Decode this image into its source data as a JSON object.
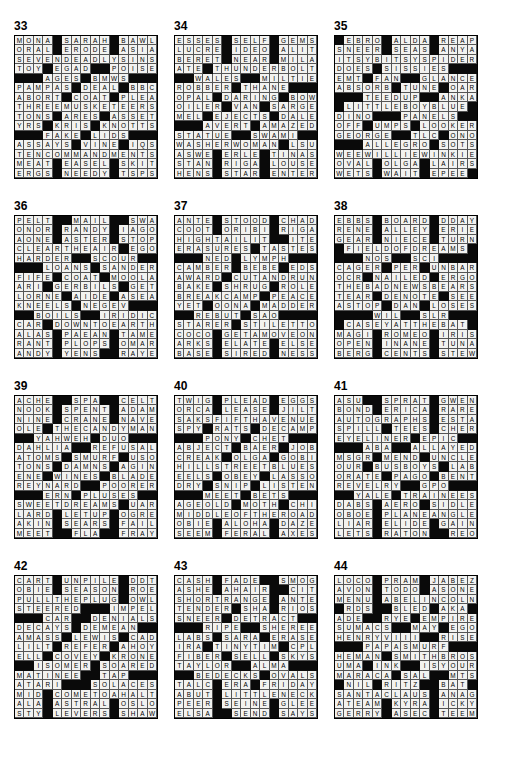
{
  "page": {
    "columns": 3,
    "rows": 4,
    "grid_size": 15,
    "block_char": "#",
    "colors": {
      "block": "#0a0a0a",
      "open": "#f2f2f0",
      "text": "#000000",
      "page_background": "#ffffff"
    }
  },
  "puzzles": [
    {
      "number": "33",
      "rows": [
        "MONA#SARAH#BAWL",
        "ORAL#ERODE#ASIA",
        "SEVENDEADLYSINS",
        "TOY#EGAD##POISES",
        "###AGES#BMWS###",
        "PAMPAS#DEAL#BBC",
        "ABORT#COAT#PLEA",
        "THREEMUSKETEERS",
        "TONS#ARES#ASSET",
        "YRS#KRIS#KNOTTS",
        "###FAKE#LIDS###",
        "ASSAYS#VINE#IQS",
        "TENCOMMANDMENTS",
        "MEAT#EASEL#SKIT",
        "ERGS#NEEDY#TSPS"
      ]
    },
    {
      "number": "34",
      "rows": [
        "ESSES#SELF#GEMS",
        "LUCRE#IDEO#ALIT",
        "BERET#NEAR#MILA",
        "ATE#THUNDERBOLT",
        "##WALES##MILTIE",
        "ROBBER#THANE###",
        "OPAL#DARING#BOW",
        "OILER#VAN#SARGE",
        "MEL#EJECTS#DALE",
        "###AVERT#AMAZED",
        "STATUE##SWAMI##",
        "WASHERWOMAN#LSU",
        "ASWE#ERLE#TINAS",
        "STAN#RIGA#LOUSE",
        "HENS#STAR#ENTER"
      ]
    },
    {
      "number": "35",
      "rows": [
        "#EBRO#ALDA#REAP",
        "SNEER#SEAS#ANYA",
        "ITSYBITSYSPIDER",
        "DOES#SISSIES###",
        "EMT#FAN##GLANCE",
        "ABSORB#TUNE#OAR",
        "###TEEDUP##ANKA",
        "#LITTLEBOYBLUE#",
        "DINO###PANELS##",
        "OFF#UMPS#LOOKER",
        "GEORGE##TLC#ONO",
        "###ALLEGRO#SOTS",
        "WEEWILLIEWINKIE",
        "OVAL#OLGA#LAIRS",
        "WETS#WAIT#EPEE#"
      ]
    },
    {
      "number": "36",
      "rows": [
        "PELT##MAIL##SWAT",
        "ONOR#RANDY#IAGO",
        "AONE#ASTER#STOP",
        "CLEARTHEAIR#EGO",
        "HARDER##SCOUR##",
        "###LOANS#SANDER",
        "FIFE#COAT#MOOLA",
        "ARI#GERBILS#GET",
        "LORNE#AIDE#ASEA",
        "KNEELS#NEGEV###",
        "##BOILS##IRIDIC",
        "CAR#DOWNTOEARTH",
        "ALAS#PAEAN#TAME",
        "RANT#PLOPS#OMAR",
        "ANDY#YENS##RAYE"
      ]
    },
    {
      "number": "37",
      "rows": [
        "ANTE#STOOD#CHAD",
        "COOT#ORIBI#RIGA",
        "HIGHTAILIT##ITEM",
        "ERASURES#TASTES",
        "###NED#LYMPH###",
        "CAMBER#BEBE#EDS",
        "AWARD#CUTANDRUN",
        "BAKE#SHRUG#ROLE",
        "BREAKCAMP#PEACE",
        "YET#OONA#MADDER",
        "##REBUT#SAO####",
        "STARER#STILETTO",
        "COCO#GETAMOVEON",
        "ARKS#ELATE#ELSE",
        "BASE#SIRED#NESS"
      ]
    },
    {
      "number": "38",
      "rows": [
        "EBBS#BOARD#DDAY",
        "RENE#ALLEY#ERIE",
        "GEAR#NIECE#TURN",
        "#FIELDOFDREAMS#",
        "###NOS##SCI####",
        "CAGER#PER#UNBAR",
        "OCR#NAILED#ERGO",
        "THEBADNEWSBEARS",
        "TEAR#DENOTE#SEE",
        "ASTOP#DAN#LOSES",
        "####WIL##SLR###",
        "#CASEYATTHEBAT#",
        "MAGI#ROMEO#IRIS",
        "OPEN#INANE#TUNA",
        "BERG#CENTS#STEW"
      ]
    },
    {
      "number": "39",
      "rows": [
        "ACHE##SPA##CELT",
        "NOOK#SPENT#ADAM",
        "NINE#CRANE#NAVE",
        "OLE#THECANDYMAN",
        "##YAHWEH#DUO###",
        "DAHLIA##REFUSAL",
        "ATOMS#SMURF#USO",
        "TONS#DAMNS#AGIN",
        "ENE#WINES#BLADE",
        "REYNARD##POORER",
        "###ERN#PLUSES##",
        "SWEETDREAMS#UAR",
        "LARD#LETUP#OGRE",
        "AKIN#SEARS#FAIL",
        "MEET##FLA##FRAY"
      ]
    },
    {
      "number": "40",
      "rows": [
        "TWIG#PLEAD#EGGS",
        "ORCA#LEASE#JILT",
        "SAKSFIFTHAVENUE",
        "SPY#RATS#DECAMP",
        "###PONY#CHET###",
        "ABJECT#BAER#JOB",
        "CREAK#OLGA#GOBI",
        "HILLSTREETBLUES",
        "EELS#OBEY#LASSO",
        "DRY#SNIP#LISTEN",
        "###MEET#BETS###",
        "AGEOLD#MOTH#CHI",
        "MIDDLEOFTHEROAD",
        "OBIE#ALOHA#DAZE",
        "SEEM#FERAL#AXES"
      ]
    },
    {
      "number": "41",
      "rows": [
        "ASU##SPRAT#GWEN",
        "BOND#ERICA#RARE",
        "AUTOGRAPHS#ESTA",
        "SPILL#TEES#CHER",
        "EYELINER#EPIC##",
        "###ABA##ALLAYED",
        "MSGR#MEND#UNCLE",
        "OUR#BUSBOYS#LAB",
        "ORATE#PAGO#BENT",
        "REVELRY##GPO###",
        "##YALE#TRAINEES",
        "DABS#AERO#SIDLE",
        "OBOE#PLANEANGLE",
        "LIAR#ELIDE#GAIN",
        "LETS#RATON##REO"
      ]
    },
    {
      "number": "42",
      "rows": [
        "CART#UNPILE#DDT",
        "OBIE#SEASON#ROE",
        "PULLTHEPLUG#OWL",
        "STEERED###IMPEL",
        "###CAR##DENIALS",
        "DECAYS#DEMEAN##",
        "AMASS#LEWIS#CAD",
        "LILT#REFER#AHOY",
        "ELL#COVEY#KRONE",
        "##ISOMER#SOARED",
        "MATINEE##TAP###",
        "ATARI###SOLACES",
        "MID#COMETOAHALT",
        "ALA#ASTRAL#OSLO",
        "STY#LEVERS#SHAW"
      ]
    },
    {
      "number": "43",
      "rows": [
        "CASH#FADE##SMOG",
        "ASHE#AHAIR##CITE",
        "SHORTRANGE#ANTE",
        "TENDER#SHA#RIOS",
        "SNEER#DETRACT##",
        "###RIPE##SHEREE",
        "LABS#SARA#ERASE",
        "IRA#TINYTIM#CPL",
        "FIBER#SELL#SKYS",
        "TAYLOR##ALMA###",
        "##BEDECKS#OVALS",
        "TALC#ERA#FRIDAY",
        "ABUT#LITTLENECK",
        "PEER#SEINE#GLEE",
        "ELSA##SEND#SAYS"
      ]
    },
    {
      "number": "44",
      "rows": [
        "LOCO#PRAM#JABEZ",
        "AVON#TODO#ASONE",
        "MENU#ABELINCOLN",
        "#RDS##BLED#AKA#",
        "ADE##RYE#EMPIRE",
        "SUMACS##MAY#EGO",
        "HENRYVIII##RISEN",
        "###PAPASMURF###",
        "HEMAN#SMITHBROS",
        "UMA#INK##ISYOUR",
        "MARACA#SAL##MTS",
        "#NIL#RITZ##BAT#",
        "SANTACLAUS#ANAG",
        "ATEAM#KYRA#ICKY",
        "GERRY#ASEC#TEEM"
      ]
    }
  ],
  "layout": {
    "col_x": [
      14,
      174,
      334
    ],
    "row_y": [
      20,
      200,
      380,
      560
    ],
    "grid_offset_y": 16
  }
}
